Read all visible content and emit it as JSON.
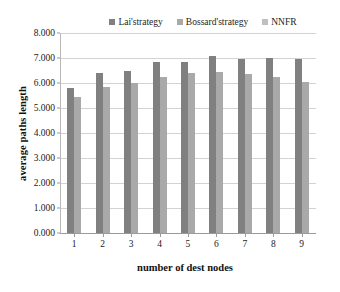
{
  "chart_data": {
    "type": "bar",
    "title": "",
    "xlabel": "number of dest nodes",
    "ylabel": "average paths length",
    "categories": [
      "1",
      "2",
      "3",
      "4",
      "5",
      "6",
      "7",
      "8",
      "9"
    ],
    "ylim": [
      0,
      8
    ],
    "ytick_labels": [
      "0.000",
      "1.000",
      "2.000",
      "3.000",
      "4.000",
      "5.000",
      "6.000",
      "7.000",
      "8.000"
    ],
    "ytick_values": [
      0,
      1,
      2,
      3,
      4,
      5,
      6,
      7,
      8
    ],
    "grid": true,
    "legend_position": "top",
    "series": [
      {
        "name": "Lai'strategy",
        "color": "#808080",
        "values": [
          5.8,
          6.4,
          6.5,
          6.85,
          6.85,
          7.1,
          6.95,
          7.0,
          6.95
        ]
      },
      {
        "name": "Bossard'strategy",
        "color": "#a9a9a9",
        "values": [
          5.45,
          5.85,
          6.0,
          6.25,
          6.4,
          6.45,
          6.35,
          6.25,
          6.05
        ]
      },
      {
        "name": "NNFR",
        "color": "#c0c0c0",
        "values": [
          null,
          null,
          null,
          null,
          null,
          null,
          null,
          null,
          null
        ]
      }
    ]
  }
}
